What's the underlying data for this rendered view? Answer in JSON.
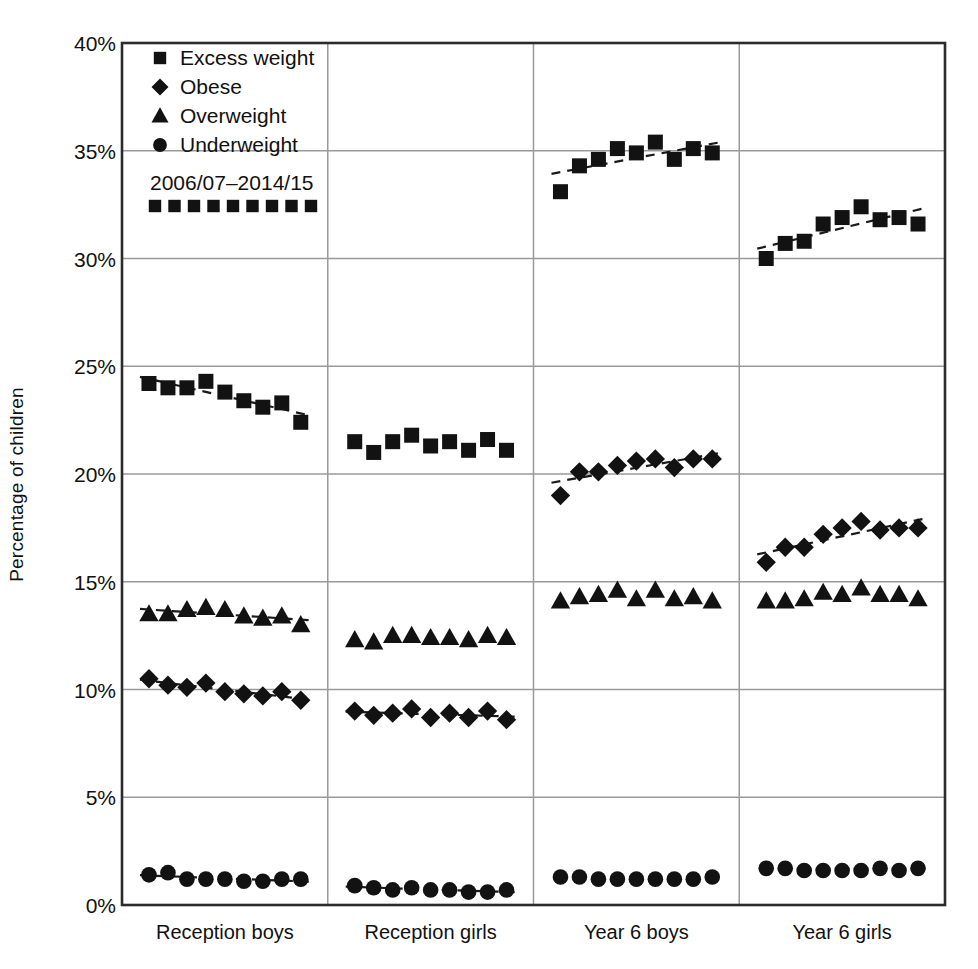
{
  "chart_data": {
    "type": "scatter",
    "title": "",
    "xlabel": "",
    "ylabel": "Percentage of children",
    "ylim": [
      0,
      40
    ],
    "ytick_labels": [
      "0%",
      "5%",
      "10%",
      "15%",
      "20%",
      "25%",
      "30%",
      "35%",
      "40%"
    ],
    "ytick_values": [
      0,
      5,
      10,
      15,
      20,
      25,
      30,
      35,
      40
    ],
    "grid": true,
    "legend_position": "top-left",
    "legend": [
      {
        "label": "Excess weight",
        "marker": "square"
      },
      {
        "label": "Obese",
        "marker": "diamond"
      },
      {
        "label": "Overweight",
        "marker": "triangle"
      },
      {
        "label": "Underweight",
        "marker": "circle"
      }
    ],
    "series_range_label": "2006/07–2014/15",
    "years": [
      "2006/07",
      "2007/08",
      "2008/09",
      "2009/10",
      "2010/11",
      "2011/12",
      "2012/13",
      "2013/14",
      "2014/15"
    ],
    "groups": [
      {
        "name": "Reception boys",
        "series": [
          {
            "name": "Excess weight",
            "marker": "square",
            "trend": true,
            "values": [
              24.2,
              24.0,
              24.0,
              24.3,
              23.8,
              23.4,
              23.1,
              23.3,
              22.4
            ]
          },
          {
            "name": "Overweight",
            "marker": "triangle",
            "trend": true,
            "values": [
              13.5,
              13.5,
              13.7,
              13.8,
              13.7,
              13.4,
              13.3,
              13.4,
              13.0
            ]
          },
          {
            "name": "Obese",
            "marker": "diamond",
            "trend": true,
            "values": [
              10.5,
              10.2,
              10.1,
              10.3,
              9.9,
              9.8,
              9.7,
              9.9,
              9.5
            ]
          },
          {
            "name": "Underweight",
            "marker": "circle",
            "trend": true,
            "values": [
              1.4,
              1.5,
              1.2,
              1.2,
              1.2,
              1.1,
              1.1,
              1.2,
              1.2
            ]
          }
        ]
      },
      {
        "name": "Reception girls",
        "series": [
          {
            "name": "Excess weight",
            "marker": "square",
            "trend": false,
            "values": [
              21.5,
              21.0,
              21.5,
              21.8,
              21.3,
              21.5,
              21.1,
              21.6,
              21.1
            ]
          },
          {
            "name": "Overweight",
            "marker": "triangle",
            "trend": false,
            "values": [
              12.3,
              12.2,
              12.5,
              12.5,
              12.4,
              12.4,
              12.3,
              12.5,
              12.4
            ]
          },
          {
            "name": "Obese",
            "marker": "diamond",
            "trend": true,
            "values": [
              9.0,
              8.8,
              8.9,
              9.1,
              8.7,
              8.9,
              8.7,
              9.0,
              8.6
            ]
          },
          {
            "name": "Underweight",
            "marker": "circle",
            "trend": true,
            "values": [
              0.9,
              0.8,
              0.7,
              0.8,
              0.7,
              0.7,
              0.6,
              0.6,
              0.7
            ]
          }
        ]
      },
      {
        "name": "Year 6 boys",
        "series": [
          {
            "name": "Excess weight",
            "marker": "square",
            "trend": true,
            "values": [
              33.1,
              34.3,
              34.6,
              35.1,
              34.9,
              35.4,
              34.6,
              35.1,
              34.9
            ]
          },
          {
            "name": "Obese",
            "marker": "diamond",
            "trend": true,
            "values": [
              19.0,
              20.1,
              20.1,
              20.4,
              20.6,
              20.7,
              20.3,
              20.7,
              20.7
            ]
          },
          {
            "name": "Overweight",
            "marker": "triangle",
            "trend": false,
            "values": [
              14.1,
              14.3,
              14.4,
              14.6,
              14.2,
              14.6,
              14.2,
              14.3,
              14.1
            ]
          },
          {
            "name": "Underweight",
            "marker": "circle",
            "trend": false,
            "values": [
              1.3,
              1.3,
              1.2,
              1.2,
              1.2,
              1.2,
              1.2,
              1.2,
              1.3
            ]
          }
        ]
      },
      {
        "name": "Year 6 girls",
        "series": [
          {
            "name": "Excess weight",
            "marker": "square",
            "trend": true,
            "values": [
              30.0,
              30.7,
              30.8,
              31.6,
              31.9,
              32.4,
              31.8,
              31.9,
              31.6
            ]
          },
          {
            "name": "Obese",
            "marker": "diamond",
            "trend": true,
            "values": [
              15.9,
              16.6,
              16.6,
              17.2,
              17.5,
              17.8,
              17.4,
              17.5,
              17.5
            ]
          },
          {
            "name": "Overweight",
            "marker": "triangle",
            "trend": false,
            "values": [
              14.1,
              14.1,
              14.2,
              14.5,
              14.4,
              14.7,
              14.4,
              14.4,
              14.2
            ]
          },
          {
            "name": "Underweight",
            "marker": "circle",
            "trend": false,
            "values": [
              1.7,
              1.7,
              1.6,
              1.6,
              1.6,
              1.6,
              1.7,
              1.6,
              1.7
            ]
          }
        ]
      }
    ]
  }
}
